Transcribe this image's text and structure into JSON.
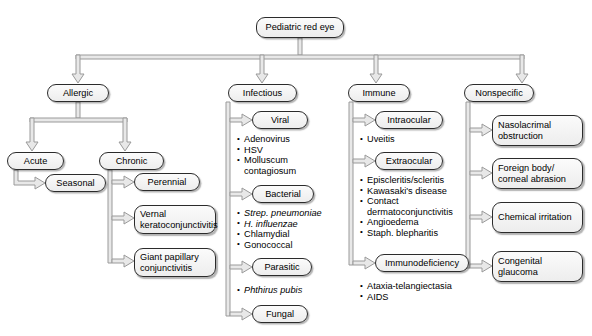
{
  "diagram": {
    "title": "Pediatric red eye",
    "type": "flowchart",
    "root": {
      "label": "Pediatric red eye"
    },
    "branches": [
      {
        "id": "allergic",
        "label": "Allergic",
        "children": [
          {
            "id": "acute",
            "label": "Acute",
            "children": [
              {
                "id": "seasonal",
                "label": "Seasonal"
              }
            ]
          },
          {
            "id": "chronic",
            "label": "Chronic",
            "children": [
              {
                "id": "perennial",
                "label": "Perennial"
              },
              {
                "id": "vernal",
                "label": "Vernal keratoconjunctivitis"
              },
              {
                "id": "giant-papillary",
                "label": "Giant papillary conjunctivitis"
              }
            ]
          }
        ]
      },
      {
        "id": "infectious",
        "label": "Infectious",
        "children": [
          {
            "id": "viral",
            "label": "Viral",
            "items": [
              {
                "text": "Adenovirus",
                "italic": false
              },
              {
                "text": "HSV",
                "italic": false
              },
              {
                "text": "Molluscum\ncontagiosum",
                "italic": false
              }
            ]
          },
          {
            "id": "bacterial",
            "label": "Bacterial",
            "items": [
              {
                "text": "Strep. pneumoniae",
                "italic": true
              },
              {
                "text": "H. influenzae",
                "italic": true
              },
              {
                "text": "Chlamydial",
                "italic": false
              },
              {
                "text": "Gonococcal",
                "italic": false
              }
            ]
          },
          {
            "id": "parasitic",
            "label": "Parasitic",
            "items": [
              {
                "text": "Phthirus pubis",
                "italic": true
              }
            ]
          },
          {
            "id": "fungal",
            "label": "Fungal",
            "items": []
          }
        ]
      },
      {
        "id": "immune",
        "label": "Immune",
        "children": [
          {
            "id": "intraocular",
            "label": "Intraocular",
            "items": [
              {
                "text": "Uveitis",
                "italic": false
              }
            ]
          },
          {
            "id": "extraocular",
            "label": "Extraocular",
            "items": [
              {
                "text": "Episcleritis/scleritis",
                "italic": false
              },
              {
                "text": "Kawasaki's disease",
                "italic": false
              },
              {
                "text": "Contact\ndermatoconjunctivitis",
                "italic": false
              },
              {
                "text": "Angioedema",
                "italic": false
              },
              {
                "text": "Staph. blepharitis",
                "italic": false
              }
            ]
          },
          {
            "id": "immunodeficiency",
            "label": "Immunodeficiency",
            "items": [
              {
                "text": "Ataxia-telangiectasia",
                "italic": false
              },
              {
                "text": "AIDS",
                "italic": false
              }
            ]
          }
        ]
      },
      {
        "id": "nonspecific",
        "label": "Nonspecific",
        "children": [
          {
            "id": "nasolacrimal",
            "label": "Nasolacrimal obstruction"
          },
          {
            "id": "foreign-body",
            "label": "Foreign body/ corneal abrasion"
          },
          {
            "id": "chemical",
            "label": "Chemical irritation"
          },
          {
            "id": "congenital-glaucoma",
            "label": "Congenital glaucoma"
          }
        ]
      }
    ],
    "colors": {
      "node_border": "#2b2b2b",
      "node_fill_top": "#fbfbfb",
      "node_fill_bottom": "#ededed",
      "connector_fill": "#e8e8e8",
      "connector_stroke": "#9a9a9a",
      "background": "#ffffff",
      "text": "#000000"
    }
  }
}
